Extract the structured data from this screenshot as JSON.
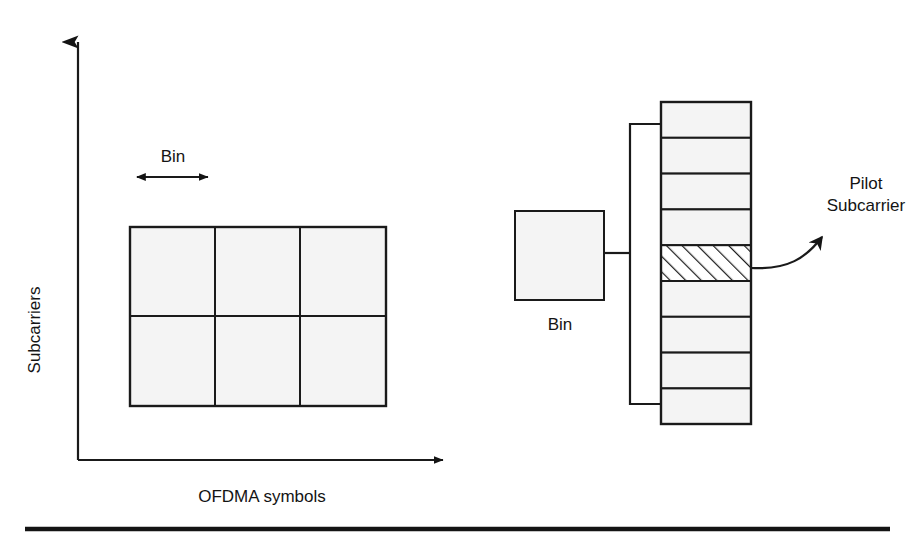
{
  "figure": {
    "kind": "ofdma-bin-structure-diagram",
    "background_color": "#ffffff",
    "line_color": "#1a1a1a",
    "cell_fill_color": "#f4f4f4"
  },
  "axes": {
    "y_axis_label": "Subcarriers",
    "x_axis_label": "OFDMA symbols",
    "origin": {
      "x": 78,
      "y": 460
    },
    "y_axis_tip": {
      "x": 78,
      "y": 30
    },
    "x_axis_tip": {
      "x": 455,
      "y": 460
    }
  },
  "bin_measure": {
    "label": "Bin",
    "arrow_left_x": 130,
    "arrow_right_x": 215,
    "arrow_y": 177,
    "label_x": 173,
    "label_y": 158
  },
  "resource_grid": {
    "columns": 3,
    "rows": 2,
    "left": 130,
    "top": 227,
    "right": 386,
    "bottom": 406,
    "column_dividers": [
      215,
      300
    ],
    "row_dividers": [
      316
    ]
  },
  "bin_box": {
    "label": "Bin",
    "left": 515,
    "top": 211,
    "right": 604,
    "bottom": 300,
    "label_x": 560,
    "label_y": 324
  },
  "bracket": {
    "vertical_x": 630,
    "top_y": 124,
    "bottom_y": 404,
    "stem_y": 253,
    "stem_from_x": 604,
    "arm_to_x": 661
  },
  "subcarrier_stack": {
    "left": 661,
    "top": 102,
    "right": 751,
    "bottom": 424,
    "cell_count": 9,
    "highlighted_cell_index": 4,
    "highlight_style": "diagonal-hatch"
  },
  "callout": {
    "line_1": "Pilot",
    "line_2": "Subcarrier",
    "text_x": 866,
    "text_line1_y": 183,
    "text_line2_y": 205,
    "arrow_start": {
      "x": 751,
      "y": 268
    },
    "arrow_tip": {
      "x": 831,
      "y": 228
    }
  },
  "footer_rule": {
    "left": 25,
    "right": 890,
    "y": 528,
    "thickness": 4
  }
}
